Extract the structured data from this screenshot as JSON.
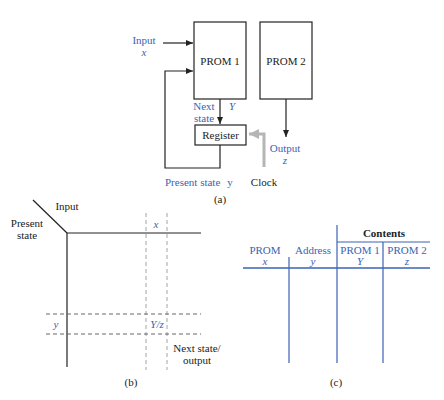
{
  "colors": {
    "black": "#222222",
    "blue": "#3b63b5",
    "gray_arrow": "#b5b5b5",
    "dashed": "#9a9a9a"
  },
  "panel_a": {
    "input_label": "Input",
    "input_var": "x",
    "prom1_label": "PROM 1",
    "prom2_label": "PROM 2",
    "next_state_line1": "Next",
    "next_state_line2": "state",
    "next_state_var": "Y",
    "register_label": "Register",
    "output_label": "Output",
    "output_var": "z",
    "present_state_label": "Present state",
    "present_state_var": "y",
    "clock_label": "Clock",
    "caption": "(a)"
  },
  "panel_b": {
    "input_label": "Input",
    "present_state_line1": "Present",
    "present_state_line2": "state",
    "column_var": "x",
    "row_var": "y",
    "cell_value": "Y/z",
    "next_state_output_line1": "Next state/",
    "next_state_output_line2": "output",
    "caption": "(b)"
  },
  "panel_c": {
    "group_header": "Contents",
    "columns": [
      {
        "label": "PROM",
        "var": "x"
      },
      {
        "label": "Address",
        "var": "y"
      },
      {
        "label": "PROM 1",
        "var": "Y"
      },
      {
        "label": "PROM 2",
        "var": "z"
      }
    ],
    "caption": "(c)"
  }
}
